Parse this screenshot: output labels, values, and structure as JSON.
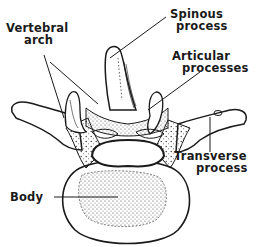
{
  "diagram": {
    "labels": {
      "vertebral_arch_line1": "Vertebral",
      "vertebral_arch_line2": "arch",
      "spinous_line1": "Spinous",
      "spinous_line2": "process",
      "articular_line1": "Articular",
      "articular_line2": "processes",
      "transverse_line1": "Transverse",
      "transverse_line2": "process",
      "body": "Body"
    },
    "colors": {
      "ink": "#1a1a1a",
      "background": "#ffffff",
      "stipple": "#555555"
    }
  }
}
